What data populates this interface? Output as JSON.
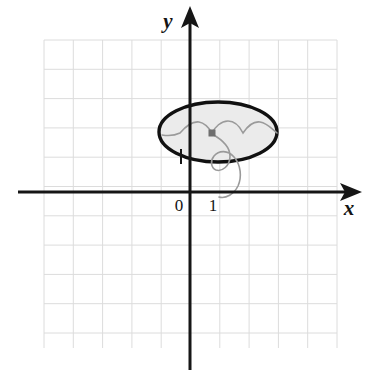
{
  "figure": {
    "background_color": "#ffffff",
    "axis_color": "#161616",
    "grid_color": "#dcdcdc",
    "ellipse_stroke_color": "#111111",
    "ellipse_fill_color": "#ebebeb",
    "curve_color": "#9a9a9a",
    "marker_color": "#6f6f6f"
  },
  "axes": {
    "x_axis": {
      "label": "x",
      "label_x": 349,
      "label_y": 215,
      "line_y": 192,
      "line_x_start": 18,
      "line_x_end": 345,
      "stroke_width": 3,
      "arrow": "right"
    },
    "y_axis": {
      "label": "y",
      "label_x": 168,
      "label_y": 28,
      "line_x": 190,
      "line_y_start": 16,
      "line_y_end": 370,
      "stroke_width": 3,
      "arrow": "up"
    }
  },
  "ticks": [
    {
      "name": "origin",
      "label": "0",
      "x": 179,
      "y": 211
    },
    {
      "name": "unit-one",
      "label": "1",
      "x": 213,
      "y": 211
    }
  ],
  "tick_mark": {
    "name": "y-axis-short-tick",
    "x": 181,
    "y_start": 149,
    "y_end": 164,
    "stroke_width": 2
  },
  "grid": {
    "left": 44,
    "top": 40,
    "right": 337,
    "bottom": 348,
    "cell_size": 29.3,
    "columns": 10,
    "rows": 10,
    "stroke_width": 1,
    "visible": true
  },
  "ellipse": {
    "name": "shaded-ellipse",
    "center_x": 218,
    "center_y": 132,
    "radius_x": 59,
    "radius_y": 30,
    "stroke_width": 3.4
  },
  "center_marker": {
    "name": "ellipse-center-point",
    "x": 212,
    "y": 133,
    "size": 7
  },
  "curves": [
    {
      "name": "scalloped-arc-chain",
      "path": "M 162 135 C 168 136 174 136 180 133 C 186 126 192 121 199 122 C 205 123 209 128 212 133 C 215 127 221 121 228 121 C 235 121 240 127 243 133 C 247 127 253 121 260 122 C 267 123 271 128 277 133"
    },
    {
      "name": "descending-spiral-curve",
      "path": "M 212 134 C 221 139 230 146 230 156 C 230 166 222 172 216 170 C 211 168 210 161 214 156 C 219 150 228 150 234 157 C 241 165 242 177 238 186 C 234 194 226 199 219 197"
    }
  ]
}
